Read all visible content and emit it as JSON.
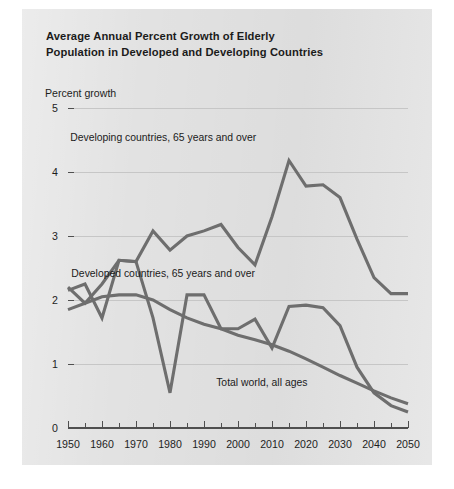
{
  "figure": {
    "title_line1": "Average Annual Percent Growth of Elderly",
    "title_line2": "Population in Developed and Developing Countries",
    "y_axis_caption": "Percent growth",
    "background_color": "#e2e2e2",
    "line_color": "#6e6e6e",
    "grid_color": "#c6c6c6"
  },
  "chart_data": {
    "type": "line",
    "title": "Average Annual Percent Growth of Elderly Population in Developed and Developing Countries",
    "xlabel": "",
    "ylabel": "Percent growth",
    "xlim": [
      1950,
      2050
    ],
    "ylim": [
      0,
      5
    ],
    "grid": true,
    "legend_position": "inline-annotations",
    "xticks": [
      1950,
      1960,
      1970,
      1980,
      1990,
      2000,
      2010,
      2020,
      2030,
      2040,
      2050
    ],
    "xticks_minor_step": 5,
    "yticks": [
      0,
      1,
      2,
      3,
      4,
      5
    ],
    "annotations": [
      {
        "text": "Developing countries, 65 years and over",
        "x": 1978,
        "y": 4.48
      },
      {
        "text": "Developed countries, 65 years and over",
        "x": 1978,
        "y": 2.36
      },
      {
        "text": "Total world, all ages",
        "x": 2007,
        "y": 0.66
      }
    ],
    "series": [
      {
        "name": "Developing countries, 65 years and over",
        "x": [
          1950,
          1955,
          1960,
          1965,
          1970,
          1975,
          1980,
          1985,
          1990,
          1995,
          2000,
          2005,
          2010,
          2015,
          2020,
          2025,
          2030,
          2035,
          2040,
          2045,
          2050
        ],
        "values": [
          2.15,
          2.25,
          1.72,
          2.62,
          2.6,
          3.08,
          2.78,
          3.0,
          3.08,
          3.18,
          2.82,
          2.55,
          3.3,
          4.18,
          3.78,
          3.8,
          3.6,
          2.95,
          2.35,
          2.1,
          2.1
        ]
      },
      {
        "name": "Developed countries, 65 years and over",
        "x": [
          1950,
          1955,
          1960,
          1965,
          1970,
          1975,
          1980,
          1985,
          1990,
          1995,
          2000,
          2005,
          2010,
          2015,
          2020,
          2025,
          2030,
          2035,
          2040,
          2045,
          2050
        ],
        "values": [
          2.2,
          1.95,
          2.25,
          2.62,
          2.6,
          1.72,
          0.55,
          2.08,
          2.08,
          1.55,
          1.55,
          1.7,
          1.25,
          1.9,
          1.92,
          1.88,
          1.6,
          0.95,
          0.55,
          0.35,
          0.25
        ]
      },
      {
        "name": "Total world, all ages",
        "x": [
          1950,
          1955,
          1960,
          1965,
          1970,
          1975,
          1980,
          1985,
          1990,
          1995,
          2000,
          2005,
          2010,
          2015,
          2020,
          2025,
          2030,
          2035,
          2040,
          2045,
          2050
        ],
        "values": [
          1.85,
          1.95,
          2.05,
          2.08,
          2.08,
          2.0,
          1.85,
          1.72,
          1.62,
          1.55,
          1.45,
          1.38,
          1.3,
          1.2,
          1.08,
          0.95,
          0.82,
          0.7,
          0.58,
          0.47,
          0.38
        ]
      }
    ]
  }
}
